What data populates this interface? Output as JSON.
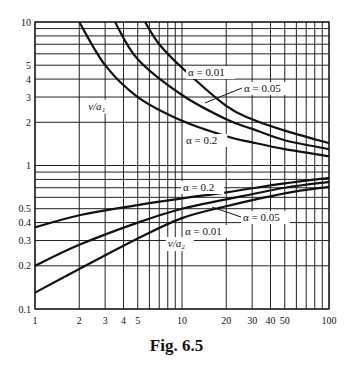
{
  "chart_data": {
    "type": "line",
    "title": "",
    "caption": "Fig. 6.5",
    "xscale": "log",
    "yscale": "log",
    "xlim": [
      1,
      100
    ],
    "ylim": [
      0.1,
      10
    ],
    "grid": true,
    "x_ticks": [
      1,
      2,
      3,
      4,
      5,
      10,
      20,
      30,
      40,
      50,
      100
    ],
    "x_tick_labels": [
      "1",
      "2",
      "3",
      "4",
      "5",
      "10",
      "20",
      "30",
      "40",
      "50",
      "100"
    ],
    "y_ticks": [
      0.1,
      0.2,
      0.3,
      0.4,
      0.5,
      1,
      2,
      3,
      4,
      5,
      10
    ],
    "y_tick_labels": [
      "0.1",
      "0.2",
      "0.3",
      "0.4",
      "0.5",
      "1",
      "2",
      "3",
      "4",
      "5",
      "10"
    ],
    "x_gridlines": [
      1,
      2,
      3,
      4,
      5,
      6,
      7,
      8,
      9,
      10,
      20,
      30,
      40,
      50,
      60,
      70,
      80,
      90,
      100
    ],
    "y_gridlines": [
      0.1,
      0.2,
      0.3,
      0.4,
      0.5,
      0.6,
      0.7,
      0.8,
      0.9,
      1,
      2,
      3,
      4,
      5,
      6,
      7,
      8,
      9,
      10
    ],
    "group_labels": [
      {
        "text": "ν/a₁",
        "x": 2.3,
        "y": 2.45
      },
      {
        "text": "ν/a₂",
        "x": 8.0,
        "y": 0.27
      }
    ],
    "series": [
      {
        "name": "ν/a₁, α = 0.01",
        "group": "upper",
        "label": "α = 0.01",
        "points": [
          [
            5.6,
            10
          ],
          [
            7,
            7
          ],
          [
            10,
            4.8
          ],
          [
            20,
            2.6
          ],
          [
            30,
            2.1
          ],
          [
            50,
            1.75
          ],
          [
            100,
            1.43
          ]
        ]
      },
      {
        "name": "ν/a₁, α = 0.05",
        "group": "upper",
        "label": "α = 0.05",
        "points": [
          [
            3.5,
            10
          ],
          [
            5,
            5.5
          ],
          [
            10,
            3.1
          ],
          [
            20,
            2.1
          ],
          [
            30,
            1.8
          ],
          [
            50,
            1.5
          ],
          [
            100,
            1.3
          ]
        ]
      },
      {
        "name": "ν/a₁, α = 0.2",
        "group": "upper",
        "label": "α = 0.2",
        "points": [
          [
            2,
            10
          ],
          [
            3,
            5
          ],
          [
            5,
            3
          ],
          [
            10,
            2.05
          ],
          [
            20,
            1.6
          ],
          [
            30,
            1.45
          ],
          [
            50,
            1.3
          ],
          [
            100,
            1.16
          ]
        ]
      },
      {
        "name": "ν/a₂, α = 0.2",
        "group": "lower",
        "label": "α = 0.2",
        "points": [
          [
            1,
            0.37
          ],
          [
            2,
            0.45
          ],
          [
            5,
            0.53
          ],
          [
            10,
            0.59
          ],
          [
            20,
            0.65
          ],
          [
            50,
            0.75
          ],
          [
            100,
            0.82
          ]
        ]
      },
      {
        "name": "ν/a₂, α = 0.05",
        "group": "lower",
        "label": "α = 0.05",
        "points": [
          [
            1,
            0.2
          ],
          [
            2,
            0.28
          ],
          [
            5,
            0.4
          ],
          [
            10,
            0.5
          ],
          [
            20,
            0.58
          ],
          [
            50,
            0.7
          ],
          [
            100,
            0.77
          ]
        ]
      },
      {
        "name": "ν/a₂, α = 0.01",
        "group": "lower",
        "label": "α = 0.01",
        "points": [
          [
            1,
            0.13
          ],
          [
            2,
            0.19
          ],
          [
            5,
            0.31
          ],
          [
            10,
            0.43
          ],
          [
            20,
            0.52
          ],
          [
            50,
            0.64
          ],
          [
            100,
            0.71
          ]
        ]
      }
    ],
    "annotations": [
      {
        "text": "α = 0.01",
        "px": [
          188,
          76
        ]
      },
      {
        "text": "α = 0.05",
        "px": [
          244,
          92
        ],
        "leader": [
          [
            205,
            103
          ],
          [
            242,
            88
          ]
        ]
      },
      {
        "text": "α = 0.2",
        "px": [
          186,
          144
        ]
      },
      {
        "text": "α = 0.2",
        "px": [
          183,
          191
        ]
      },
      {
        "text": "α = 0.05",
        "px": [
          243,
          221
        ],
        "leader": [
          [
            212,
            207
          ],
          [
            241,
            217
          ]
        ]
      },
      {
        "text": "α = 0.01",
        "px": [
          185,
          235
        ]
      }
    ],
    "layout": {
      "left": 35,
      "right": 329,
      "top": 22,
      "bottom": 309
    }
  }
}
